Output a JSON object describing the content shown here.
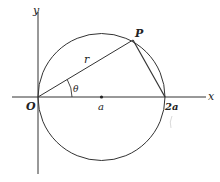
{
  "diagram": {
    "type": "geometry",
    "axes": {
      "x_label": "x",
      "y_label": "y"
    },
    "points": {
      "origin": "O",
      "center": "a",
      "end": "2a",
      "point_on_circle": "P"
    },
    "segments": {
      "op_label": "r"
    },
    "angle_label": "θ",
    "colors": {
      "stroke": "#333333",
      "text": "#222222",
      "background": "#ffffff"
    }
  }
}
